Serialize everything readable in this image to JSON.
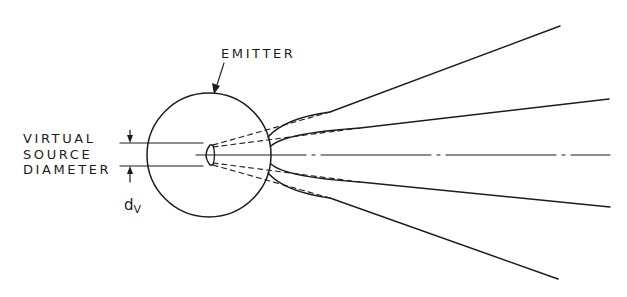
{
  "diagram": {
    "labels": {
      "emitter": "EMITTER",
      "virtual_source_line1": "VIRTUAL",
      "virtual_source_line2": "SOURCE",
      "virtual_source_line3": "DIAMETER",
      "dv_main": "d",
      "dv_sub": "V"
    },
    "colors": {
      "ink": "#1c1c1c",
      "background": "#ffffff"
    },
    "elements": {
      "emitter_circle": {
        "cx": 209,
        "cy": 155,
        "r": 62
      },
      "axis": "dash-dot center line",
      "rays": [
        {
          "name": "upper-outer",
          "end": [
            560,
            26
          ]
        },
        {
          "name": "upper-inner",
          "end": [
            609,
            99
          ]
        },
        {
          "name": "lower-inner",
          "end": [
            610,
            207
          ]
        },
        {
          "name": "lower-outer",
          "end": [
            558,
            279
          ]
        }
      ]
    }
  }
}
